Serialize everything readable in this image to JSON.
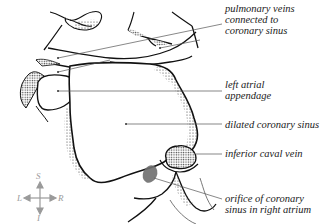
{
  "diagram": {
    "type": "anatomical line illustration",
    "labels": [
      {
        "id": "pulmonary-veins",
        "text": "pulmonary veins\nconnected to\ncoronary sinus"
      },
      {
        "id": "left-atrial-appendage",
        "text": "left atrial\nappendage"
      },
      {
        "id": "dilated-coronary-sinus",
        "text": "dilated coronary sinus"
      },
      {
        "id": "inferior-caval-vein",
        "text": "inferior caval vein"
      },
      {
        "id": "orifice-coronary-sinus",
        "text": "orifice of coronary\nsinus in right atrium"
      }
    ],
    "orientation_compass": {
      "superior": "S",
      "inferior": "I",
      "left": "L",
      "right": "R"
    },
    "colors": {
      "line": "#111111",
      "leader": "#555555",
      "stipple": "#333333",
      "orifice_fill": "#6e6e6e",
      "compass": "#9a9a9a"
    }
  }
}
